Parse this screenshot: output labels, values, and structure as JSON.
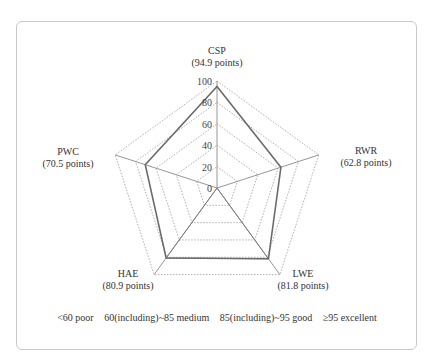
{
  "chart_data": {
    "type": "radar",
    "title": "",
    "categories": [
      "CSP",
      "RWR",
      "LWE",
      "HAE",
      "PWC"
    ],
    "values": [
      94.9,
      62.8,
      81.8,
      80.9,
      70.5
    ],
    "value_labels": [
      "(94.9 points)",
      "(62.8 points)",
      "(81.8 points)",
      "(80.9 points)",
      "(70.5 points)"
    ],
    "rlim": [
      0,
      100
    ],
    "rticks": [
      0,
      20,
      40,
      60,
      80,
      100
    ],
    "grid": "dotted pentagons at each tick",
    "legend": [
      "<60 poor",
      "60(including)~85 medium",
      "85(including)~95 good",
      "≥95 excellent"
    ]
  },
  "colors": {
    "series_line": "#6b6b6b",
    "grid": "#9a9a9a",
    "axis": "#8a8a8a",
    "inner_wedge": "#7a7a7a",
    "card_border": "#c8c8c8"
  },
  "labels": {
    "csp": {
      "name": "CSP",
      "pts": "(94.9 points)"
    },
    "rwr": {
      "name": "RWR",
      "pts": "(62.8 points)"
    },
    "lwe": {
      "name": "LWE",
      "pts": "(81.8 points)"
    },
    "hae": {
      "name": "HAE",
      "pts": "(80.9 points)"
    },
    "pwc": {
      "name": "PWC",
      "pts": "(70.5 points)"
    }
  },
  "ticks": [
    "0",
    "20",
    "40",
    "60",
    "80",
    "100"
  ],
  "legend": {
    "poor": "<60 poor",
    "medium": "60(including)~85 medium",
    "good": "85(including)~95 good",
    "excellent": "≥95 excellent"
  }
}
